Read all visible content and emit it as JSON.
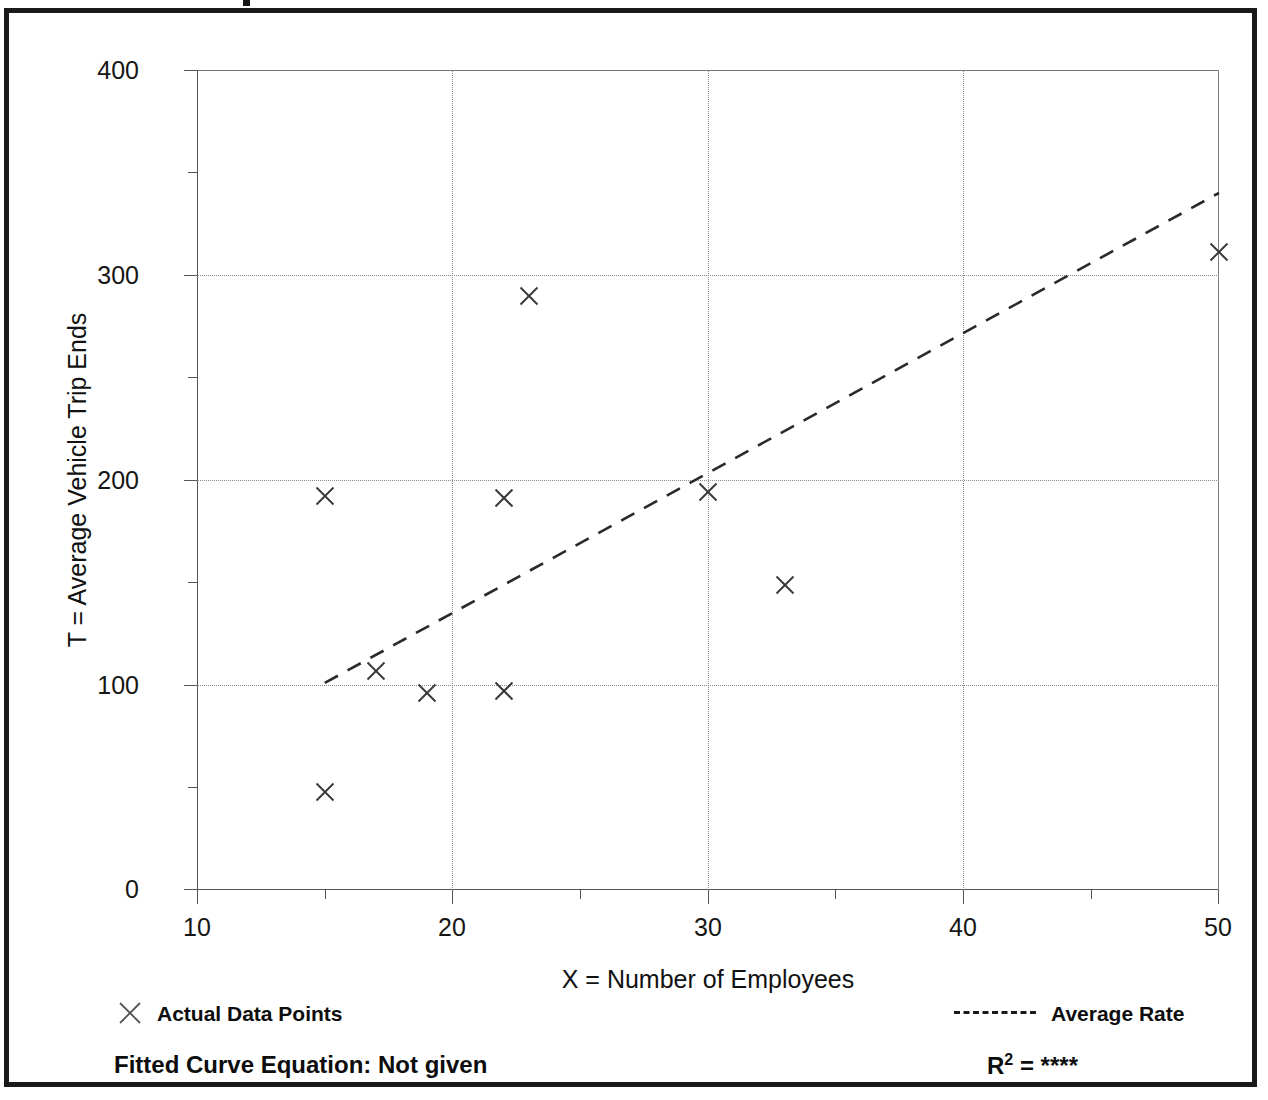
{
  "chart_data": {
    "type": "scatter",
    "title": "",
    "xlabel": "X = Number of Employees",
    "ylabel": "T = Average Vehicle Trip Ends",
    "xlim": [
      10,
      50
    ],
    "ylim": [
      0,
      400
    ],
    "x_ticks": [
      10,
      20,
      30,
      40,
      50
    ],
    "x_tick_labels": [
      "10",
      "20",
      "30",
      "40",
      "50"
    ],
    "x_minor_ticks": [
      15,
      25,
      35,
      45
    ],
    "y_ticks": [
      0,
      100,
      200,
      300,
      400
    ],
    "y_tick_labels": [
      "0",
      "100",
      "200",
      "300",
      "400"
    ],
    "y_minor_ticks": [
      50,
      150,
      250,
      350
    ],
    "grid": true,
    "grid_style": "dotted",
    "gridlines_x": [
      20,
      30,
      40,
      50
    ],
    "gridlines_y": [
      100,
      200,
      300
    ],
    "legend_position": "below-plot",
    "series": [
      {
        "name": "Actual Data Points",
        "type": "scatter",
        "marker": "x",
        "color": "#3a3a3a",
        "points": [
          {
            "x": 15,
            "y": 48
          },
          {
            "x": 15,
            "y": 192
          },
          {
            "x": 17,
            "y": 107
          },
          {
            "x": 19,
            "y": 96
          },
          {
            "x": 22,
            "y": 97
          },
          {
            "x": 22,
            "y": 191
          },
          {
            "x": 23,
            "y": 290
          },
          {
            "x": 30,
            "y": 194
          },
          {
            "x": 33,
            "y": 149
          },
          {
            "x": 50,
            "y": 311
          }
        ]
      },
      {
        "name": "Average Rate",
        "type": "line",
        "style": "dashed",
        "color": "#2a2a2a",
        "endpoints": [
          {
            "x": 15,
            "y": 101
          },
          {
            "x": 50,
            "y": 340
          }
        ]
      }
    ],
    "annotations": {
      "fitted_curve_equation_label": "Fitted Curve Equation:",
      "fitted_curve_equation_value": "Not given",
      "r_squared_symbol": "R",
      "r_squared_exponent": "2",
      "r_squared_equals": "=",
      "r_squared_value": "****"
    }
  },
  "legend": {
    "points_marker": "x-marker-icon",
    "points_label": "Actual Data Points",
    "rate_marker": "dashed-line-icon",
    "rate_label": "Average Rate"
  },
  "equation": {
    "full_text": "Fitted Curve Equation:  Not given",
    "r_symbol": "R",
    "r_exponent": "2",
    "r_equals": " = ",
    "r_value": "****"
  },
  "colors": {
    "frame": "#1a1a1a",
    "axis": "#555555",
    "grid": "#8a8a8a",
    "marker": "#3a3a3a",
    "trendline": "#2a2a2a",
    "text": "#111111",
    "background": "#ffffff"
  }
}
